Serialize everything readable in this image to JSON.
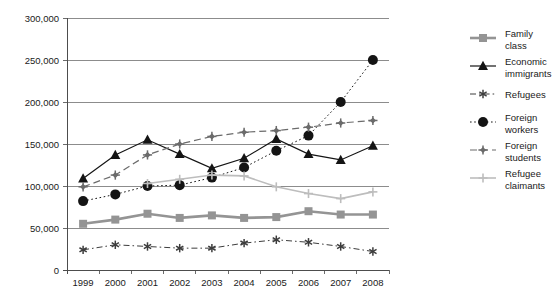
{
  "chart_data": {
    "type": "line",
    "title": "",
    "subtitle": "",
    "xlabel": "",
    "ylabel": "",
    "categories": [
      "1999",
      "2000",
      "2001",
      "2002",
      "2003",
      "2004",
      "2005",
      "2006",
      "2007",
      "2008"
    ],
    "x": [
      1999,
      2000,
      2001,
      2002,
      2003,
      2004,
      2005,
      2006,
      2007,
      2008
    ],
    "ylim": [
      0,
      300000
    ],
    "y_ticks": [
      0,
      50000,
      100000,
      150000,
      200000,
      250000,
      300000
    ],
    "y_tick_labels": [
      "0",
      "50,000",
      "100,000",
      "150,000",
      "200,000",
      "250,000",
      "300,000"
    ],
    "grid": true,
    "legend_position": "right",
    "series": [
      {
        "name": "Family class",
        "marker": "square",
        "color": "#949494",
        "line_style": "solid",
        "line_width": 2.6,
        "values": [
          55000,
          60000,
          67000,
          62000,
          65000,
          62000,
          63000,
          70000,
          66000,
          66000
        ]
      },
      {
        "name": "Economic immigrants",
        "marker": "triangle",
        "color": "#141414",
        "line_style": "solid",
        "line_width": 1.2,
        "values": [
          109000,
          137000,
          155000,
          138000,
          121000,
          133000,
          156000,
          138000,
          131000,
          148000
        ]
      },
      {
        "name": "Refugees",
        "marker": "asterisk",
        "color": "#3d3d3d",
        "line_style": "dashdot",
        "line_width": 1,
        "values": [
          24000,
          30000,
          28000,
          26000,
          26000,
          32000,
          36000,
          33000,
          28000,
          22000
        ]
      },
      {
        "name": "Foreign workers",
        "marker": "circle",
        "color": "#141414",
        "line_style": "dotted",
        "line_width": 1,
        "values": [
          82000,
          90000,
          100000,
          101000,
          110000,
          122000,
          142000,
          160000,
          200000,
          250000
        ]
      },
      {
        "name": "Foreign students",
        "marker": "cross-diamond",
        "color": "#6b6b6b",
        "line_style": "dashed",
        "line_width": 1.2,
        "values": [
          99000,
          113000,
          137000,
          150000,
          159000,
          164000,
          166000,
          170000,
          175000,
          178000
        ]
      },
      {
        "name": "Refugee claimants",
        "marker": "plus",
        "color": "#bdbdbd",
        "line_style": "solid",
        "line_width": 1.6,
        "values": [
          null,
          null,
          103000,
          108000,
          113000,
          112000,
          99000,
          91000,
          85000,
          93000
        ]
      }
    ]
  },
  "legend": {
    "items": [
      {
        "label_line1": "Family",
        "label_line2": "class"
      },
      {
        "label_line1": "Economic",
        "label_line2": "immigrants"
      },
      {
        "label_line1": "Refugees",
        "label_line2": ""
      },
      {
        "label_line1": "Foreign",
        "label_line2": "workers"
      },
      {
        "label_line1": "Foreign",
        "label_line2": "students"
      },
      {
        "label_line1": "Refugee",
        "label_line2": "claimants"
      }
    ]
  },
  "colors": {
    "family_class": "#949494",
    "economic_immigrants": "#141414",
    "refugees": "#3d3d3d",
    "foreign_workers": "#141414",
    "foreign_students": "#6b6b6b",
    "refugee_claimants": "#bdbdbd",
    "gridline": "#8c8c8c",
    "axis": "#4d4d4d",
    "text": "#1a1a1a",
    "background": "#ffffff"
  }
}
